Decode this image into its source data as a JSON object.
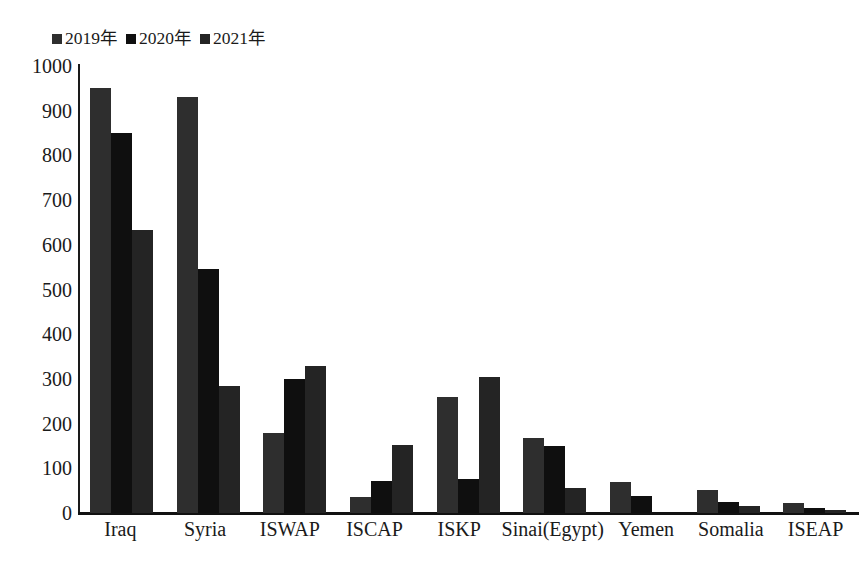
{
  "chart_data": {
    "type": "bar",
    "title": "",
    "subtitle": "",
    "xlabel": "",
    "ylabel": "",
    "ylim": [
      0,
      1000
    ],
    "ytick_labels": [
      "1000",
      "900",
      "800",
      "700",
      "600",
      "500",
      "400",
      "300",
      "200",
      "100",
      "0"
    ],
    "ytick_values": [
      1000,
      900,
      800,
      700,
      600,
      500,
      400,
      300,
      200,
      100,
      0
    ],
    "grid": false,
    "legend_position": "top-left",
    "categories": [
      "Iraq",
      "Syria",
      "ISWAP",
      "ISCAP",
      "ISKP",
      "Sinai(Egypt)",
      "Yemen",
      "Somalia",
      "ISEAP"
    ],
    "series": [
      {
        "name": "2019年",
        "color": "#2e2e2e",
        "values": [
          950,
          930,
          180,
          35,
          260,
          168,
          70,
          52,
          22
        ]
      },
      {
        "name": "2020年",
        "color": "#0f0f0f",
        "values": [
          850,
          545,
          300,
          72,
          75,
          150,
          38,
          25,
          12
        ]
      },
      {
        "name": "2021年",
        "color": "#242424",
        "values": [
          633,
          285,
          328,
          153,
          305,
          57,
          0,
          16,
          6
        ]
      }
    ]
  },
  "legend": {
    "entries": [
      {
        "label": "2019年"
      },
      {
        "label": "2020年"
      },
      {
        "label": "2021年"
      }
    ]
  }
}
